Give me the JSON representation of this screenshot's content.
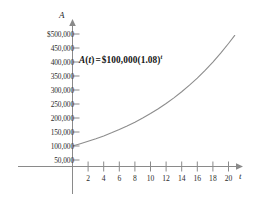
{
  "chart_data": {
    "type": "line",
    "title": "",
    "annotation": "A(t) = $100,000(1.08)^t",
    "annotation_parts": {
      "func_name": "A",
      "open_paren": "(",
      "variable": "t",
      "close_paren": ")",
      "equals": "=",
      "principal": "$100,000",
      "base_open": "(",
      "base": "1.08",
      "base_close": ")",
      "exponent": "t"
    },
    "xlabel": "t",
    "ylabel": "A",
    "xlim": [
      0,
      21.5
    ],
    "ylim": [
      0,
      525000
    ],
    "grid": false,
    "legend": null,
    "x_ticks": [
      2,
      4,
      6,
      8,
      10,
      12,
      14,
      16,
      18,
      20
    ],
    "x_tick_labels": [
      "2",
      "4",
      "6",
      "8",
      "10",
      "12",
      "14",
      "16",
      "18",
      "20"
    ],
    "y_ticks": [
      50000,
      100000,
      150000,
      200000,
      250000,
      300000,
      350000,
      400000,
      450000,
      500000
    ],
    "y_tick_labels": [
      "50,000",
      "100,000",
      "150,000",
      "200,000",
      "250,000",
      "300,000",
      "350,000",
      "400,000",
      "450,000",
      "$500,000"
    ],
    "series": [
      {
        "name": "A(t)",
        "color": "#8d8d8d",
        "x": [
          0,
          1,
          2,
          3,
          4,
          5,
          6,
          7,
          8,
          9,
          10,
          11,
          12,
          13,
          14,
          15,
          16,
          17,
          18,
          19,
          20,
          20.8
        ],
        "values": [
          100000,
          108000,
          116640,
          125971,
          136049,
          146933,
          158687,
          171382,
          185093,
          199900,
          215892,
          233164,
          251817,
          271962,
          293719,
          317217,
          342594,
          370002,
          399602,
          431570,
          466096,
          494800
        ]
      }
    ]
  },
  "colors": {
    "axis": "#8a8a8a",
    "curve": "#8d8d8d",
    "text": "#2b2b2b",
    "background": "#ffffff"
  }
}
